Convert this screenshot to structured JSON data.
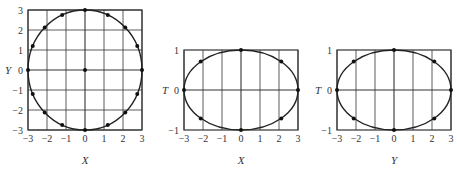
{
  "chart_data": [
    {
      "type": "scatter",
      "title": "",
      "xlabel": "X",
      "ylabel": "Y",
      "xlim": [
        -3,
        3
      ],
      "ylim": [
        -3,
        3
      ],
      "xticks": [
        "−3",
        "−2",
        "−1",
        "0",
        "1",
        "2",
        "3"
      ],
      "yticks": [
        "3",
        "2",
        "1",
        "0",
        "−1",
        "−2",
        "−3"
      ],
      "grid": true,
      "curve": "circle x^2 + y^2 = 9",
      "points": [
        [
          0,
          0
        ],
        [
          3,
          0
        ],
        [
          -3,
          0
        ],
        [
          0,
          3
        ],
        [
          0,
          -3
        ],
        [
          2.12,
          2.12
        ],
        [
          -2.12,
          2.12
        ],
        [
          2.12,
          -2.12
        ],
        [
          -2.12,
          -2.12
        ],
        [
          1.2,
          2.75
        ],
        [
          -1.2,
          2.75
        ],
        [
          1.2,
          -2.75
        ],
        [
          -1.2,
          -2.75
        ],
        [
          2.75,
          1.2
        ],
        [
          -2.75,
          1.2
        ],
        [
          2.75,
          -1.2
        ],
        [
          -2.75,
          -1.2
        ]
      ]
    },
    {
      "type": "scatter",
      "title": "",
      "xlabel": "X",
      "ylabel": "T",
      "xlim": [
        -3,
        3
      ],
      "ylim": [
        -1,
        1
      ],
      "xticks": [
        "−3",
        "−2",
        "−1",
        "0",
        "1",
        "2",
        "3"
      ],
      "yticks": [
        "1",
        "0",
        "−1"
      ],
      "grid": "vertical + T=0",
      "curve": "ellipse (x/3)^2 + t^2 = 1",
      "points": [
        [
          0,
          1
        ],
        [
          0,
          -1
        ],
        [
          3,
          0
        ],
        [
          -3,
          0
        ],
        [
          2.12,
          0.71
        ],
        [
          -2.12,
          0.71
        ],
        [
          2.12,
          -0.71
        ],
        [
          -2.12,
          -0.71
        ]
      ]
    },
    {
      "type": "scatter",
      "title": "",
      "xlabel": "Y",
      "ylabel": "T",
      "xlim": [
        -3,
        3
      ],
      "ylim": [
        -1,
        1
      ],
      "xticks": [
        "−3",
        "−2",
        "−1",
        "0",
        "1",
        "2",
        "3"
      ],
      "yticks": [
        "1",
        "0",
        "−1"
      ],
      "grid": "vertical + T=0",
      "curve": "ellipse (y/3)^2 + t^2 = 1",
      "points": [
        [
          0,
          1
        ],
        [
          0,
          -1
        ],
        [
          3,
          0
        ],
        [
          -3,
          0
        ],
        [
          2.12,
          0.71
        ],
        [
          -2.12,
          0.71
        ],
        [
          2.12,
          -0.71
        ],
        [
          -2.12,
          -0.71
        ]
      ]
    }
  ],
  "labels": {
    "p1_x": "X",
    "p1_y": "Y",
    "p2_x": "X",
    "p2_y": "T",
    "p3_x": "Y",
    "p3_y": "T"
  }
}
